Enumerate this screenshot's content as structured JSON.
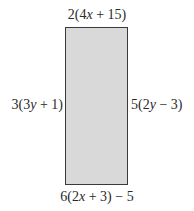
{
  "diagram": {
    "shape": "rectangle",
    "fill_color": "#d9d9d9",
    "stroke_color": "#3a3a3a",
    "labels": {
      "top": "2(4x + 15)",
      "bottom": "6(2x + 3) − 5",
      "left": "3(3y + 1)",
      "right": "5(2y − 3)"
    }
  }
}
